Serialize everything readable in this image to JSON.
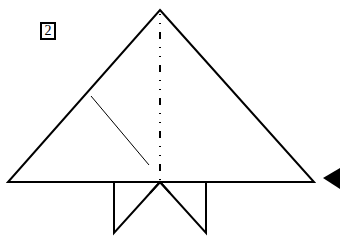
{
  "diagram": {
    "type": "origami-step",
    "step_number": "2",
    "colors": {
      "stroke": "#000000",
      "paper": "#ffffff"
    },
    "elements": {
      "main_triangle": "folded paper triangle",
      "center_line": "mountain fold line (dash-dot-dot)",
      "crease_line": "thin diagonal crease",
      "bottom_flaps": "two triangular flaps below base",
      "arrow": "turn-over indicator triangle pointing left"
    }
  }
}
